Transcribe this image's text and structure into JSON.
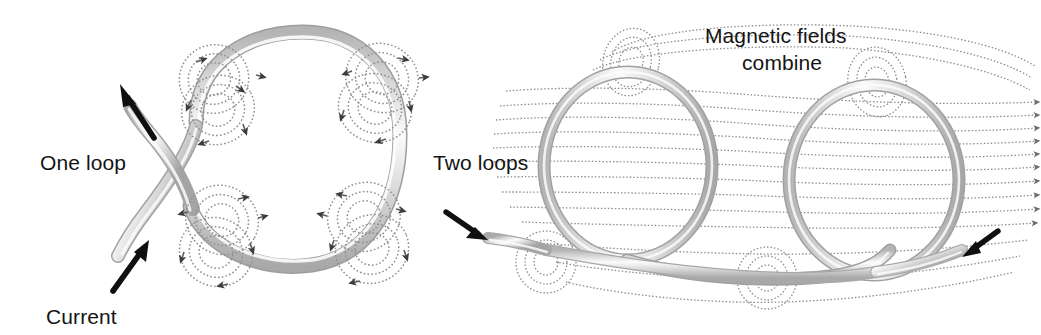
{
  "figure": {
    "background_color": "#ffffff",
    "width": 1041,
    "height": 335,
    "wire_color": "#c9c9c9",
    "wire_highlight_color": "#f2f2f2",
    "wire_shadow_color": "#9c9c9c",
    "field_line_color": "#8d8d8d",
    "arrow_color": "#111111",
    "text_color": "#141414"
  },
  "panels": [
    {
      "id": "one-loop",
      "label": "One loop",
      "current_label": "Current",
      "description": "A single circular loop of wire with concentric magnetic field circles around the wire at four points.",
      "field_circle_count": 4,
      "rings_per_circle": 3
    },
    {
      "id": "two-loops",
      "label": "Two loops",
      "combine_label_line1": "Magnetic fields",
      "combine_label_line2": "combine",
      "description": "Two circular loops of wire side by side; horizontal magnetic field lines thread through both loops and combine.",
      "field_line_count": 13,
      "loop_count": 2
    }
  ],
  "labels": {
    "one_loop": "One loop",
    "current": "Current",
    "two_loops": "Two loops",
    "magnetic_fields": "Magnetic fields",
    "combine": "combine"
  }
}
